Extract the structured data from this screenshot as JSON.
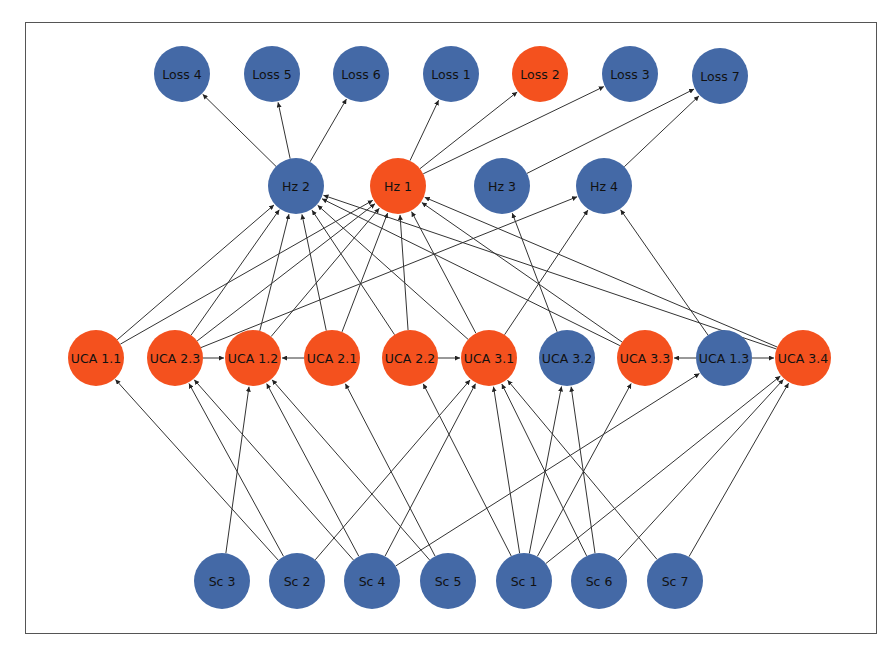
{
  "diagram": {
    "type": "directed-graph",
    "colors": {
      "highlighted": "#F4511E",
      "normal": "#4469A6",
      "edge": "#333333",
      "frame": "#555555"
    },
    "node_radius": 28,
    "nodes": [
      {
        "id": "Loss 4",
        "x": 182,
        "y": 74,
        "highlighted": false
      },
      {
        "id": "Loss 5",
        "x": 272,
        "y": 74,
        "highlighted": false
      },
      {
        "id": "Loss 6",
        "x": 361,
        "y": 74,
        "highlighted": false
      },
      {
        "id": "Loss 1",
        "x": 451,
        "y": 74,
        "highlighted": false
      },
      {
        "id": "Loss 2",
        "x": 540,
        "y": 74,
        "highlighted": true
      },
      {
        "id": "Loss 3",
        "x": 630,
        "y": 74,
        "highlighted": false
      },
      {
        "id": "Loss 7",
        "x": 720,
        "y": 76,
        "highlighted": false
      },
      {
        "id": "Hz 2",
        "x": 296,
        "y": 186,
        "highlighted": false
      },
      {
        "id": "Hz 1",
        "x": 398,
        "y": 186,
        "highlighted": true
      },
      {
        "id": "Hz 3",
        "x": 502,
        "y": 186,
        "highlighted": false
      },
      {
        "id": "Hz 4",
        "x": 604,
        "y": 186,
        "highlighted": false
      },
      {
        "id": "UCA 1.1",
        "x": 96,
        "y": 358,
        "highlighted": true
      },
      {
        "id": "UCA 2.3",
        "x": 175,
        "y": 358,
        "highlighted": true
      },
      {
        "id": "UCA 1.2",
        "x": 253,
        "y": 358,
        "highlighted": true
      },
      {
        "id": "UCA 2.1",
        "x": 332,
        "y": 358,
        "highlighted": true
      },
      {
        "id": "UCA 2.2",
        "x": 410,
        "y": 358,
        "highlighted": true
      },
      {
        "id": "UCA 3.1",
        "x": 489,
        "y": 358,
        "highlighted": true
      },
      {
        "id": "UCA 3.2",
        "x": 567,
        "y": 358,
        "highlighted": false
      },
      {
        "id": "UCA 3.3",
        "x": 645,
        "y": 358,
        "highlighted": true
      },
      {
        "id": "UCA 1.3",
        "x": 724,
        "y": 358,
        "highlighted": false
      },
      {
        "id": "UCA 3.4",
        "x": 803,
        "y": 358,
        "highlighted": true
      },
      {
        "id": "Sc 3",
        "x": 222,
        "y": 581,
        "highlighted": false
      },
      {
        "id": "Sc 2",
        "x": 297,
        "y": 581,
        "highlighted": false
      },
      {
        "id": "Sc 4",
        "x": 372,
        "y": 581,
        "highlighted": false
      },
      {
        "id": "Sc 5",
        "x": 448,
        "y": 581,
        "highlighted": false
      },
      {
        "id": "Sc 1",
        "x": 524,
        "y": 581,
        "highlighted": false
      },
      {
        "id": "Sc 6",
        "x": 599,
        "y": 581,
        "highlighted": false
      },
      {
        "id": "Sc 7",
        "x": 675,
        "y": 581,
        "highlighted": false
      }
    ],
    "edges": [
      [
        "Hz 2",
        "Loss 4"
      ],
      [
        "Hz 2",
        "Loss 5"
      ],
      [
        "Hz 2",
        "Loss 6"
      ],
      [
        "Hz 1",
        "Loss 1"
      ],
      [
        "Hz 1",
        "Loss 2"
      ],
      [
        "Hz 1",
        "Loss 3"
      ],
      [
        "Hz 3",
        "Loss 7"
      ],
      [
        "Hz 4",
        "Loss 7"
      ],
      [
        "UCA 1.1",
        "Hz 2"
      ],
      [
        "UCA 1.1",
        "Hz 1"
      ],
      [
        "UCA 2.3",
        "Hz 2"
      ],
      [
        "UCA 2.3",
        "Hz 1"
      ],
      [
        "UCA 2.3",
        "Hz 4"
      ],
      [
        "UCA 1.2",
        "Hz 2"
      ],
      [
        "UCA 1.2",
        "Hz 1"
      ],
      [
        "UCA 2.1",
        "Hz 2"
      ],
      [
        "UCA 2.1",
        "Hz 1"
      ],
      [
        "UCA 2.2",
        "Hz 2"
      ],
      [
        "UCA 2.2",
        "Hz 1"
      ],
      [
        "UCA 3.1",
        "Hz 2"
      ],
      [
        "UCA 3.1",
        "Hz 1"
      ],
      [
        "UCA 3.1",
        "Hz 4"
      ],
      [
        "UCA 3.2",
        "Hz 3"
      ],
      [
        "UCA 3.3",
        "Hz 2"
      ],
      [
        "UCA 3.3",
        "Hz 1"
      ],
      [
        "UCA 1.3",
        "Hz 4"
      ],
      [
        "UCA 3.4",
        "Hz 2"
      ],
      [
        "UCA 3.4",
        "Hz 1"
      ],
      [
        "UCA 2.3",
        "UCA 1.2"
      ],
      [
        "UCA 2.1",
        "UCA 1.2"
      ],
      [
        "UCA 2.2",
        "UCA 3.1"
      ],
      [
        "UCA 1.3",
        "UCA 3.3"
      ],
      [
        "UCA 1.3",
        "UCA 3.4"
      ],
      [
        "Sc 2",
        "UCA 1.1"
      ],
      [
        "Sc 2",
        "UCA 2.3"
      ],
      [
        "Sc 2",
        "UCA 3.1"
      ],
      [
        "Sc 3",
        "UCA 1.2"
      ],
      [
        "Sc 4",
        "UCA 2.3"
      ],
      [
        "Sc 4",
        "UCA 1.2"
      ],
      [
        "Sc 4",
        "UCA 3.1"
      ],
      [
        "Sc 4",
        "UCA 1.3"
      ],
      [
        "Sc 5",
        "UCA 1.2"
      ],
      [
        "Sc 5",
        "UCA 2.1"
      ],
      [
        "Sc 1",
        "UCA 2.2"
      ],
      [
        "Sc 1",
        "UCA 3.1"
      ],
      [
        "Sc 1",
        "UCA 3.2"
      ],
      [
        "Sc 1",
        "UCA 3.3"
      ],
      [
        "Sc 1",
        "UCA 3.4"
      ],
      [
        "Sc 6",
        "UCA 3.1"
      ],
      [
        "Sc 6",
        "UCA 3.2"
      ],
      [
        "Sc 6",
        "UCA 3.4"
      ],
      [
        "Sc 7",
        "UCA 3.1"
      ],
      [
        "Sc 7",
        "UCA 3.4"
      ]
    ]
  }
}
